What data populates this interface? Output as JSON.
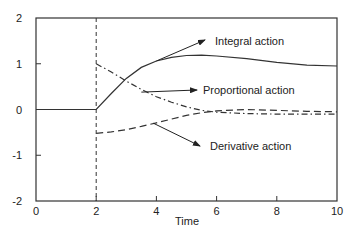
{
  "chart_data": {
    "type": "line",
    "title": "",
    "xlabel": "Time",
    "ylabel": "",
    "xlim": [
      0,
      10
    ],
    "ylim": [
      -2,
      2
    ],
    "xticks": [
      0,
      2,
      4,
      6,
      8,
      10
    ],
    "yticks": [
      -2,
      -1,
      0,
      1,
      2
    ],
    "xtick_labels": [
      "0",
      "2",
      "4",
      "6",
      "8",
      "10"
    ],
    "ytick_labels": [
      "-2",
      "-1",
      "0",
      "1",
      "2"
    ],
    "grid": false,
    "step_marker": {
      "x": 2,
      "style": "dashed"
    },
    "series": [
      {
        "name": "Integral action",
        "style": "solid",
        "x": [
          0,
          2,
          2.5,
          3,
          3.5,
          4,
          4.5,
          5,
          5.5,
          6,
          7,
          8,
          9,
          10
        ],
        "y": [
          0,
          0,
          0.35,
          0.68,
          0.92,
          1.06,
          1.14,
          1.18,
          1.19,
          1.17,
          1.11,
          1.03,
          0.97,
          0.95
        ]
      },
      {
        "name": "Proportional action",
        "style": "dash-dot",
        "x": [
          2,
          2.5,
          3,
          3.5,
          4,
          4.5,
          5,
          5.5,
          6,
          7,
          8,
          9,
          10
        ],
        "y": [
          1.0,
          0.82,
          0.62,
          0.44,
          0.28,
          0.16,
          0.06,
          -0.02,
          -0.06,
          -0.09,
          -0.1,
          -0.1,
          -0.1
        ]
      },
      {
        "name": "Derivative action",
        "style": "dashed",
        "x": [
          2,
          2.5,
          3,
          3.5,
          4,
          4.5,
          5,
          5.5,
          6,
          7,
          8,
          9,
          10
        ],
        "y": [
          -0.52,
          -0.49,
          -0.44,
          -0.37,
          -0.29,
          -0.21,
          -0.13,
          -0.07,
          -0.03,
          0.0,
          -0.02,
          -0.04,
          -0.05
        ]
      }
    ],
    "annotations": [
      {
        "text": "Integral action",
        "arrow_to_x": 4.0,
        "arrow_to_y": 1.06
      },
      {
        "text": "Proportional action",
        "arrow_to_x": 3.5,
        "arrow_to_y": 0.38
      },
      {
        "text": "Derivative action",
        "arrow_to_x": 3.9,
        "arrow_to_y": -0.3
      }
    ]
  }
}
